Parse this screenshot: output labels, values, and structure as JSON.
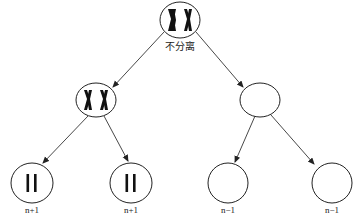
{
  "diagram": {
    "type": "cell-division-tree",
    "annotation": "不分离",
    "nodes": [
      {
        "id": "parent",
        "chromosomes": "XX (replicated, 2 chromatid pairs)"
      },
      {
        "id": "daughter-left",
        "chromosomes": "XX (replicated)"
      },
      {
        "id": "daughter-right",
        "chromosomes": "none"
      },
      {
        "id": "gamete-1",
        "chromosomes": "2 single chromatids",
        "label": "n+1"
      },
      {
        "id": "gamete-2",
        "chromosomes": "2 single chromatids",
        "label": "n+1"
      },
      {
        "id": "gamete-3",
        "chromosomes": "none",
        "label": "n−1"
      },
      {
        "id": "gamete-4",
        "chromosomes": "none",
        "label": "n−1"
      }
    ],
    "edges": [
      [
        "parent",
        "daughter-left"
      ],
      [
        "parent",
        "daughter-right"
      ],
      [
        "daughter-left",
        "gamete-1"
      ],
      [
        "daughter-left",
        "gamete-2"
      ],
      [
        "daughter-right",
        "gamete-3"
      ],
      [
        "daughter-right",
        "gamete-4"
      ]
    ],
    "labels": [
      "n+1",
      "n+1",
      "n−1",
      "n−1"
    ],
    "colors": {
      "stroke": "#222222",
      "fill": "#ffffff"
    }
  }
}
